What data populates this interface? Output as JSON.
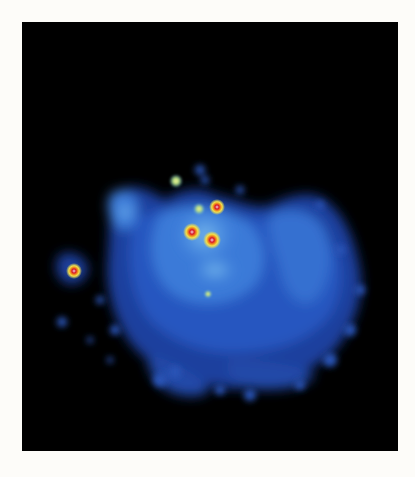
{
  "image": {
    "subject": "diffuse blue nebula-like emission with bright point sources",
    "background_color": "#fdfcf9",
    "frame_color": "#000000",
    "palette": {
      "diffuse_dark": "#1a3a9a",
      "diffuse_mid": "#2f6fd6",
      "diffuse_bright": "#5aa8f0",
      "source_halo": "#f2e04a",
      "source_ring": "#f08a1c",
      "source_core": "#d8182a"
    },
    "point_sources": [
      {
        "x": 176,
        "y": 181,
        "r": 5,
        "type": "faint"
      },
      {
        "x": 217,
        "y": 207,
        "r": 6,
        "type": "bright"
      },
      {
        "x": 199,
        "y": 209,
        "r": 4,
        "type": "faint"
      },
      {
        "x": 192,
        "y": 232,
        "r": 7,
        "type": "bright"
      },
      {
        "x": 212,
        "y": 240,
        "r": 7,
        "type": "bright"
      },
      {
        "x": 74,
        "y": 271,
        "r": 6,
        "type": "bright"
      },
      {
        "x": 208,
        "y": 294,
        "r": 3,
        "type": "faint"
      }
    ]
  }
}
